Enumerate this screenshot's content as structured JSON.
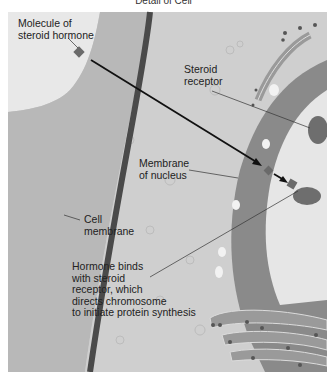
{
  "figure": {
    "title": "Detail of Cell",
    "labels": {
      "molecule": [
        "Molecule of",
        "steroid hormone"
      ],
      "receptor": [
        "Steroid",
        "receptor"
      ],
      "nuclear_membrane": [
        "Membrane",
        "of nucleus"
      ],
      "cell_membrane": [
        "Cell",
        "membrane"
      ],
      "binding": [
        "Hormone binds",
        "with steroid",
        "receptor, which",
        "directs chromosome",
        "to initiate protein synthesis"
      ]
    },
    "colors": {
      "background": "#ffffff",
      "extracellular": "#dcdcdc",
      "cytoplasm": "#c4c4c4",
      "cell_membrane": "#4a4a4a",
      "nucleus_envelope": "#8a8a8a",
      "nucleus_interior": "#e6e6e6",
      "molecule": "#6a6a6a",
      "arrow": "#111111"
    }
  }
}
